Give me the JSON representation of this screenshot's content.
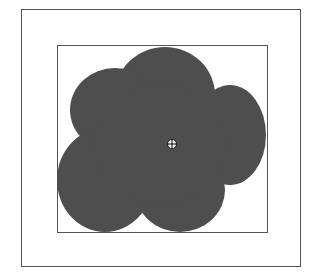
{
  "figure": {
    "outer_frame": {
      "x": 21,
      "y": 9,
      "width": 280,
      "height": 258
    },
    "inner_frame": {
      "x": 57,
      "y": 45,
      "width": 211,
      "height": 188
    },
    "blob": {
      "fill": "#4e4e4e",
      "lobes": [
        {
          "cx": 165,
          "cy": 95,
          "rx": 50,
          "ry": 48
        },
        {
          "cx": 115,
          "cy": 110,
          "rx": 45,
          "ry": 42
        },
        {
          "cx": 230,
          "cy": 135,
          "rx": 36,
          "ry": 50
        },
        {
          "cx": 105,
          "cy": 180,
          "rx": 48,
          "ry": 52
        },
        {
          "cx": 180,
          "cy": 190,
          "rx": 45,
          "ry": 42
        },
        {
          "cx": 160,
          "cy": 145,
          "rx": 65,
          "ry": 60
        }
      ]
    },
    "marker": {
      "cx": 172,
      "cy": 144,
      "r": 4.5,
      "icon": "crosshair-target-icon"
    }
  }
}
